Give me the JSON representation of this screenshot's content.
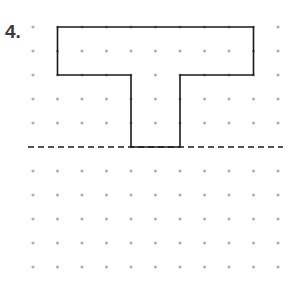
{
  "problem": {
    "number_label": "4.",
    "description": "T-shaped figure on dot grid above a dashed line of reflection"
  },
  "grid": {
    "columns": 11,
    "rows": 11,
    "x0": 33,
    "dx": 24.5,
    "y0": 27,
    "dy": 24,
    "dot_color": "#b0b0b0",
    "dot_radius": 1.6
  },
  "shape": {
    "type": "polygon",
    "stroke": "#1a1a1a",
    "grid_points": [
      [
        1,
        0
      ],
      [
        9,
        0
      ],
      [
        9,
        2
      ],
      [
        6,
        2
      ],
      [
        6,
        5
      ],
      [
        4,
        5
      ],
      [
        4,
        2
      ],
      [
        1,
        2
      ]
    ]
  },
  "dashed_line": {
    "row": 5,
    "x_start": 28,
    "x_end": 283,
    "stroke": "#1a1a1a"
  }
}
